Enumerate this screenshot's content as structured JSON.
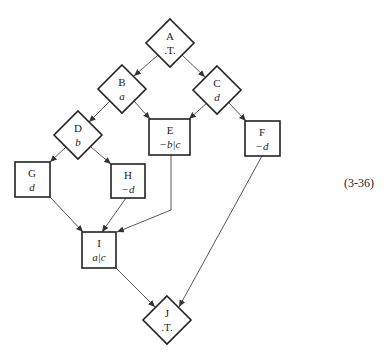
{
  "diagram": {
    "equation_number": "(3-36)",
    "nodes": {
      "A": {
        "name": "A",
        "condition": ".T.",
        "shape": "diamond"
      },
      "B": {
        "name": "B",
        "condition": "a",
        "shape": "diamond"
      },
      "C": {
        "name": "C",
        "condition": "d",
        "shape": "diamond"
      },
      "D": {
        "name": "D",
        "condition": "b",
        "shape": "diamond"
      },
      "E": {
        "name": "E",
        "condition": "−b|c",
        "shape": "box"
      },
      "F": {
        "name": "F",
        "condition": "−d",
        "shape": "box"
      },
      "G": {
        "name": "G",
        "condition": "d",
        "shape": "box"
      },
      "H": {
        "name": "H",
        "condition": "−d",
        "shape": "box"
      },
      "I": {
        "name": "I",
        "condition": "a|c",
        "shape": "box"
      },
      "J": {
        "name": "J",
        "condition": ".T.",
        "shape": "diamond"
      }
    },
    "edges": [
      {
        "from": "A",
        "to": "B"
      },
      {
        "from": "A",
        "to": "C"
      },
      {
        "from": "B",
        "to": "D"
      },
      {
        "from": "B",
        "to": "E"
      },
      {
        "from": "C",
        "to": "E"
      },
      {
        "from": "C",
        "to": "F"
      },
      {
        "from": "D",
        "to": "G"
      },
      {
        "from": "D",
        "to": "H"
      },
      {
        "from": "G",
        "to": "I"
      },
      {
        "from": "H",
        "to": "I"
      },
      {
        "from": "E",
        "to": "I"
      },
      {
        "from": "I",
        "to": "J"
      },
      {
        "from": "F",
        "to": "J"
      }
    ]
  }
}
